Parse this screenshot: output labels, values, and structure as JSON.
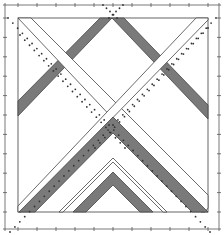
{
  "diagram": {
    "title": "",
    "type": "quilt-block-pattern",
    "colors": {
      "background": "#ffffff",
      "line": "#555555",
      "band_dark": "#7a7a7a",
      "band_light": "#ffffff",
      "dots": "#333333"
    },
    "frame": {
      "outer": [
        5,
        5,
        219,
        229
      ],
      "inner": [
        18,
        18,
        208,
        212
      ]
    },
    "ticks": {
      "top_count": 11,
      "bottom_count": 11,
      "left_count": 11,
      "right_count": 11
    },
    "bands": [
      {
        "name": "top-chevron-dark",
        "shade": "dark"
      },
      {
        "name": "x-cross-light",
        "shade": "light"
      },
      {
        "name": "middle-chevron-dark",
        "shade": "dark"
      },
      {
        "name": "inner-chevron-light",
        "shade": "light"
      },
      {
        "name": "bottom-chevron-dark",
        "shade": "dark"
      }
    ],
    "dotted_guides": [
      "diagonal-seam-left",
      "diagonal-seam-right",
      "top-center-seam"
    ]
  }
}
